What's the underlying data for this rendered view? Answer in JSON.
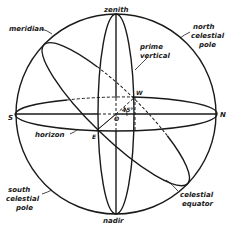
{
  "diagram": {
    "labels": {
      "zenith": "zenith",
      "nadir": "nadir",
      "meridian": "meridian",
      "north_celestial_pole_1": "north",
      "north_celestial_pole_2": "celestial",
      "north_celestial_pole_3": "pole",
      "prime_vertical_1": "prime",
      "prime_vertical_2": "vertical",
      "south_celestial_pole_1": "south",
      "south_celestial_pole_2": "celestial",
      "south_celestial_pole_3": "pole",
      "horizon": "horizon",
      "celestial_equator_1": "celestial",
      "celestial_equator_2": "equator",
      "point_s": "S",
      "point_n": "N",
      "point_e": "E",
      "point_w": "W",
      "point_o": "O",
      "angle": "45°"
    },
    "colors": {
      "ink": "#1a1a1a",
      "background": "#ffffff"
    }
  }
}
